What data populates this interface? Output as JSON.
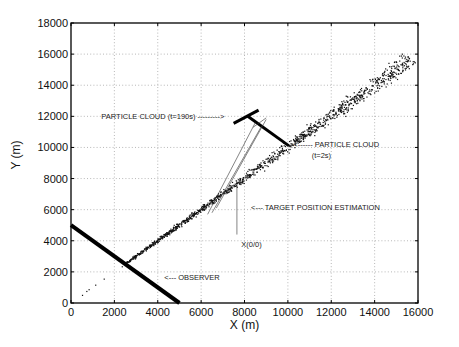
{
  "chart_data": {
    "type": "scatter",
    "title": "",
    "xlabel": "X (m)",
    "ylabel": "Y (m)",
    "xlim": [
      0,
      16000
    ],
    "ylim": [
      0,
      18000
    ],
    "xticks": [
      0,
      2000,
      4000,
      6000,
      8000,
      10000,
      12000,
      14000,
      16000
    ],
    "yticks": [
      0,
      2000,
      4000,
      6000,
      8000,
      10000,
      12000,
      14000,
      16000,
      18000
    ],
    "xtick_labels": [
      "0",
      "2000",
      "4000",
      "6000",
      "8000",
      "10000",
      "12000",
      "14000",
      "16000"
    ],
    "ytick_labels": [
      "0",
      "2000",
      "4000",
      "6000",
      "8000",
      "10000",
      "12000",
      "14000",
      "16000",
      "18000"
    ],
    "grid": true,
    "series": [
      {
        "name": "Particle cloud (t=2s)",
        "kind": "scatter-band",
        "from": [
          500,
          500
        ],
        "to": [
          15700,
          15700
        ],
        "spread_start": 80,
        "spread_end": 900,
        "count": 1400,
        "sparse_until": 2500
      },
      {
        "name": "Observer",
        "kind": "line",
        "points": [
          [
            0,
            5000
          ],
          [
            5000,
            0
          ]
        ],
        "width": 4
      },
      {
        "name": "Particle cloud (t=190s)",
        "kind": "thick-lines",
        "segments": [
          [
            [
              7500,
              11550
            ],
            [
              8650,
              12400
            ]
          ],
          [
            [
              8150,
              12000
            ],
            [
              10050,
              10100
            ]
          ]
        ],
        "width": 3
      },
      {
        "name": "Target position estimation",
        "kind": "thin-lines",
        "segments": [
          [
            [
              6300,
              5700
            ],
            [
              8500,
              11600
            ]
          ],
          [
            [
              6500,
              5800
            ],
            [
              8800,
              11400
            ]
          ],
          [
            [
              6700,
              6100
            ],
            [
              9000,
              11800
            ]
          ],
          [
            [
              8400,
              11300
            ],
            [
              9000,
              11900
            ]
          ],
          [
            [
              7650,
              4400
            ],
            [
              7650,
              7700
            ]
          ]
        ]
      }
    ],
    "annotations": [
      {
        "text": "PARTICLE CLOUD (t=190s) --------->",
        "x": 1400,
        "y": 12000
      },
      {
        "text": "<------ PARTICLE CLOUD",
        "x": 10250,
        "y": 10250
      },
      {
        "text": "(t=2s)",
        "x": 11100,
        "y": 9500
      },
      {
        "text": "<--- TARGET POSITION ESTIMATION",
        "x": 8300,
        "y": 6200
      },
      {
        "text": "X(0/0)",
        "x": 7850,
        "y": 3800
      },
      {
        "text": "<--- OBSERVER",
        "x": 4300,
        "y": 1700
      }
    ]
  },
  "axes": {
    "x_label": "X (m)",
    "y_label": "Y (m)"
  },
  "annotations": {
    "cloud_190": "PARTICLE CLOUD (t=190s) --------->",
    "cloud_2_line1": "<------ PARTICLE CLOUD",
    "cloud_2_line2": "(t=2s)",
    "target": "<--- TARGET POSITION ESTIMATION",
    "origin": "X(0/0)",
    "observer": "<--- OBSERVER"
  }
}
